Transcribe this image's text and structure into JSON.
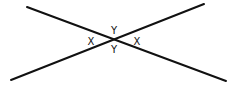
{
  "diagram": {
    "type": "intersecting-lines",
    "stroke_color": "#111111",
    "background": "#ffffff",
    "lines": [
      {
        "name": "line-1",
        "x1": 27,
        "y1": 7,
        "x2": 226,
        "y2": 81
      },
      {
        "name": "line-2",
        "x1": 11,
        "y1": 80,
        "x2": 204,
        "y2": 4
      }
    ],
    "intersection": {
      "x": 113,
      "y": 40
    },
    "labels": [
      {
        "name": "angle-label-left",
        "text": "X",
        "x": 91,
        "y": 45
      },
      {
        "name": "angle-label-top",
        "text": "Y",
        "x": 114,
        "y": 34
      },
      {
        "name": "angle-label-right",
        "text": "X",
        "x": 137,
        "y": 45
      },
      {
        "name": "angle-label-bottom",
        "text": "Y",
        "x": 114,
        "y": 53
      }
    ]
  }
}
